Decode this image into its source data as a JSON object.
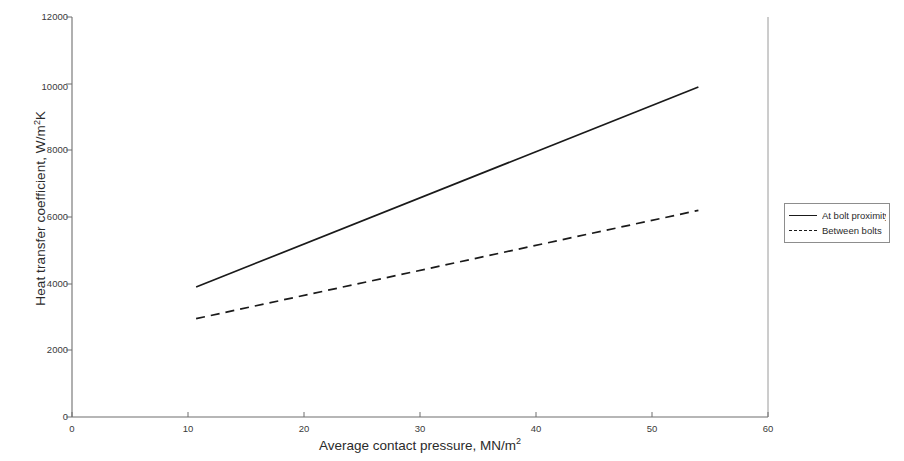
{
  "chart_data": {
    "type": "line",
    "title": "",
    "subtitle": "",
    "xlabel_text": "Average contact pressure, MN/m",
    "xlabel_sup": "2",
    "ylabel_text": "Heat transfer coefficient, W/m",
    "ylabel_sup": "2",
    "ylabel_tail": "K",
    "xlabel_full": "Average contact pressure, MN/m2",
    "ylabel_full": "Heat transfer coefficient, W/m 2K",
    "xlim": [
      0,
      60
    ],
    "ylim": [
      0,
      12000
    ],
    "xticks": [
      "0",
      "10",
      "20",
      "30",
      "40",
      "50",
      "60"
    ],
    "xtick_values": [
      0,
      10,
      20,
      30,
      40,
      50,
      60
    ],
    "yticks": [
      "0",
      "2000",
      "4000",
      "6000",
      "8000",
      "10000",
      "12000"
    ],
    "ytick_values": [
      0,
      2000,
      4000,
      6000,
      8000,
      10000,
      12000
    ],
    "grid": false,
    "legend_position": "right-outside",
    "series": [
      {
        "name": "At bolt proximity",
        "style": "solid",
        "color": "#1a1a1a",
        "x": [
          10.7,
          54.0
        ],
        "values": [
          3900,
          9900
        ]
      },
      {
        "name": "Between bolts",
        "style": "dashed",
        "color": "#1a1a1a",
        "x": [
          10.7,
          54.0
        ],
        "values": [
          2950,
          6200
        ]
      }
    ],
    "annotations": []
  },
  "legend": {
    "entries": [
      {
        "label": "At bolt proximity",
        "key": "solid-line-key"
      },
      {
        "label": "Between bolts",
        "key": "dashed-line-key"
      }
    ]
  },
  "axes": {
    "y_tick_labels": [
      "12000",
      "10000",
      "8000",
      "6000",
      "4000",
      "2000",
      "0"
    ],
    "x_tick_labels": [
      "0",
      "10",
      "20",
      "30",
      "40",
      "50",
      "60"
    ]
  }
}
